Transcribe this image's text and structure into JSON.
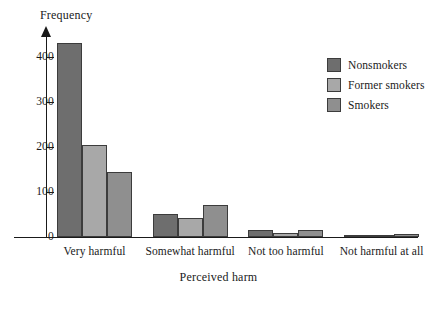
{
  "chart_data": {
    "type": "bar",
    "title": "",
    "xlabel": "Perceived harm",
    "ylabel": "Frequency",
    "categories": [
      "Very harmful",
      "Somewhat harmful",
      "Not too harmful",
      "Not harmful at all"
    ],
    "series": [
      {
        "name": "Nonsmokers",
        "color": "#6e6e6e",
        "values": [
          430,
          50,
          15,
          3
        ]
      },
      {
        "name": "Former smokers",
        "color": "#a8a8a8",
        "values": [
          205,
          42,
          10,
          2
        ]
      },
      {
        "name": "Smokers",
        "color": "#8f8f8f",
        "values": [
          145,
          70,
          16,
          7
        ]
      }
    ],
    "ylim": [
      0,
      450
    ],
    "yticks": [
      0,
      100,
      200,
      300,
      400
    ],
    "ytick_labels": [
      "0",
      "100",
      "200",
      "300",
      "400"
    ],
    "grid": false,
    "legend_position": "top-right"
  }
}
